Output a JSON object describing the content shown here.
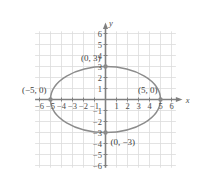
{
  "chart_data": {
    "type": "scatter",
    "title": "",
    "xlabel": "x",
    "ylabel": "y",
    "xlim": [
      -6.6,
      6.6
    ],
    "ylim": [
      -6.4,
      6.4
    ],
    "grid": true,
    "legend": null,
    "curve": {
      "kind": "ellipse",
      "center": [
        0,
        0
      ],
      "semi_major_x": 5,
      "semi_minor_y": 3,
      "equation": "x^2/25 + y^2/9 = 1",
      "color": "#8c8c8c"
    },
    "points": [
      {
        "name": "left-vertex",
        "x": -5,
        "y": 0,
        "label": "(−5, 0)"
      },
      {
        "name": "right-vertex",
        "x": 5,
        "y": 0,
        "label": "(5, 0)"
      },
      {
        "name": "top-vertex",
        "x": 0,
        "y": 3,
        "label": "(0, 3)"
      },
      {
        "name": "bottom-vertex",
        "x": 0,
        "y": -3,
        "label": "(0, −3)"
      }
    ],
    "x_ticks": [
      {
        "value": -6,
        "label": "−6"
      },
      {
        "value": -5,
        "label": "−5"
      },
      {
        "value": -4,
        "label": "−4"
      },
      {
        "value": -3,
        "label": "−3"
      },
      {
        "value": -2,
        "label": "−2"
      },
      {
        "value": -1,
        "label": "−1"
      },
      {
        "value": 1,
        "label": "1"
      },
      {
        "value": 2,
        "label": "2"
      },
      {
        "value": 3,
        "label": "3"
      },
      {
        "value": 4,
        "label": "4"
      },
      {
        "value": 5,
        "label": "5"
      },
      {
        "value": 6,
        "label": "6"
      }
    ],
    "y_ticks": [
      {
        "value": 6,
        "label": "6"
      },
      {
        "value": 5,
        "label": "5"
      },
      {
        "value": 4,
        "label": "4"
      },
      {
        "value": 3,
        "label": "3"
      },
      {
        "value": 2,
        "label": "2"
      },
      {
        "value": 1,
        "label": "1"
      },
      {
        "value": -1,
        "label": "−1"
      },
      {
        "value": -2,
        "label": "−2"
      },
      {
        "value": -3,
        "label": "−3"
      },
      {
        "value": -4,
        "label": "−4"
      },
      {
        "value": -5,
        "label": "−5"
      },
      {
        "value": -6,
        "label": "−6"
      }
    ],
    "colors": {
      "grid": "#dcdcdc",
      "axis": "#808080",
      "curve": "#8c8c8c",
      "marker": "#8a8a8a",
      "text": "#3d3d3d",
      "background": "#ffffff"
    }
  },
  "axis_labels": {
    "x": "x",
    "y": "y"
  }
}
